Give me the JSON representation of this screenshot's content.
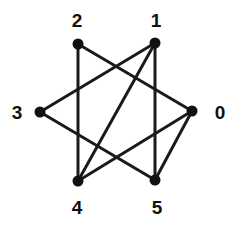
{
  "figure": {
    "kind": "undirected-graph-drawing",
    "background_color": "#ffffff",
    "stroke_color": "#1a1a1a",
    "vertex_fill_color": "#111111",
    "label_color": "#111111",
    "width": 240,
    "height": 226
  },
  "graph": {
    "vertex_count": 6,
    "edge_count": 8,
    "vertices": [
      {
        "id": "0",
        "label": "0",
        "x": 192,
        "y": 111,
        "label_x": 220,
        "label_y": 112,
        "degree": 3
      },
      {
        "id": "1",
        "label": "1",
        "x": 155,
        "y": 43,
        "label_x": 156,
        "label_y": 20,
        "degree": 3
      },
      {
        "id": "2",
        "label": "2",
        "x": 78,
        "y": 44,
        "label_x": 77,
        "label_y": 20,
        "degree": 2
      },
      {
        "id": "3",
        "label": "3",
        "x": 40,
        "y": 112,
        "label_x": 17,
        "label_y": 112,
        "degree": 2
      },
      {
        "id": "4",
        "label": "4",
        "x": 78,
        "y": 181,
        "label_x": 77,
        "label_y": 207,
        "degree": 3
      },
      {
        "id": "5",
        "label": "5",
        "x": 155,
        "y": 180,
        "label_x": 157,
        "label_y": 207,
        "degree": 3
      }
    ],
    "edges": [
      {
        "from": "2",
        "to": "0"
      },
      {
        "from": "2",
        "to": "4"
      },
      {
        "from": "1",
        "to": "3"
      },
      {
        "from": "1",
        "to": "4"
      },
      {
        "from": "1",
        "to": "5"
      },
      {
        "from": "3",
        "to": "5"
      },
      {
        "from": "0",
        "to": "4"
      },
      {
        "from": "0",
        "to": "5"
      }
    ],
    "vertex_radius": 5.5,
    "edge_width": 3
  }
}
